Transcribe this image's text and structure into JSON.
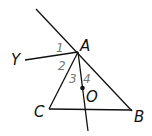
{
  "diagram": {
    "points": {
      "A": {
        "label": "A",
        "x": 78,
        "y": 52
      },
      "B": {
        "label": "B",
        "x": 131,
        "y": 110
      },
      "C": {
        "label": "C",
        "x": 49,
        "y": 109
      },
      "O": {
        "label": "O",
        "x": 82,
        "y": 88
      },
      "Y": {
        "label": "Y",
        "x": 25,
        "y": 60
      }
    },
    "angles": [
      {
        "label": "1"
      },
      {
        "label": "2"
      },
      {
        "label": "3"
      },
      {
        "label": "4"
      }
    ],
    "colors": {
      "line": "#111111",
      "angle_label": "#777777"
    }
  }
}
